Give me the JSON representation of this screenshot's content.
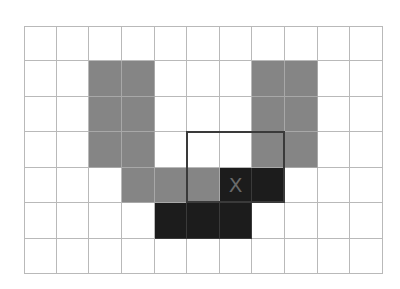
{
  "grid": {
    "rows": 7,
    "cols": 11,
    "colors": {
      "empty": "#ffffff",
      "gray": "#858585",
      "black": "#1c1c1c",
      "line": "#b9b9b9",
      "window": "#3a3a3a"
    },
    "cells": [
      {
        "r": 1,
        "c": 2,
        "v": "gray"
      },
      {
        "r": 1,
        "c": 3,
        "v": "gray"
      },
      {
        "r": 1,
        "c": 7,
        "v": "gray"
      },
      {
        "r": 1,
        "c": 8,
        "v": "gray"
      },
      {
        "r": 2,
        "c": 2,
        "v": "gray"
      },
      {
        "r": 2,
        "c": 3,
        "v": "gray"
      },
      {
        "r": 2,
        "c": 7,
        "v": "gray"
      },
      {
        "r": 2,
        "c": 8,
        "v": "gray"
      },
      {
        "r": 3,
        "c": 2,
        "v": "gray"
      },
      {
        "r": 3,
        "c": 3,
        "v": "gray"
      },
      {
        "r": 3,
        "c": 7,
        "v": "gray"
      },
      {
        "r": 3,
        "c": 8,
        "v": "gray"
      },
      {
        "r": 4,
        "c": 3,
        "v": "gray"
      },
      {
        "r": 4,
        "c": 4,
        "v": "gray"
      },
      {
        "r": 4,
        "c": 5,
        "v": "gray"
      },
      {
        "r": 4,
        "c": 6,
        "v": "black",
        "mark": "X"
      },
      {
        "r": 4,
        "c": 7,
        "v": "black"
      },
      {
        "r": 5,
        "c": 4,
        "v": "black"
      },
      {
        "r": 5,
        "c": 5,
        "v": "black"
      },
      {
        "r": 5,
        "c": 6,
        "v": "black"
      }
    ],
    "window": {
      "row": 3,
      "col": 5,
      "rows": 2,
      "cols": 3
    }
  }
}
